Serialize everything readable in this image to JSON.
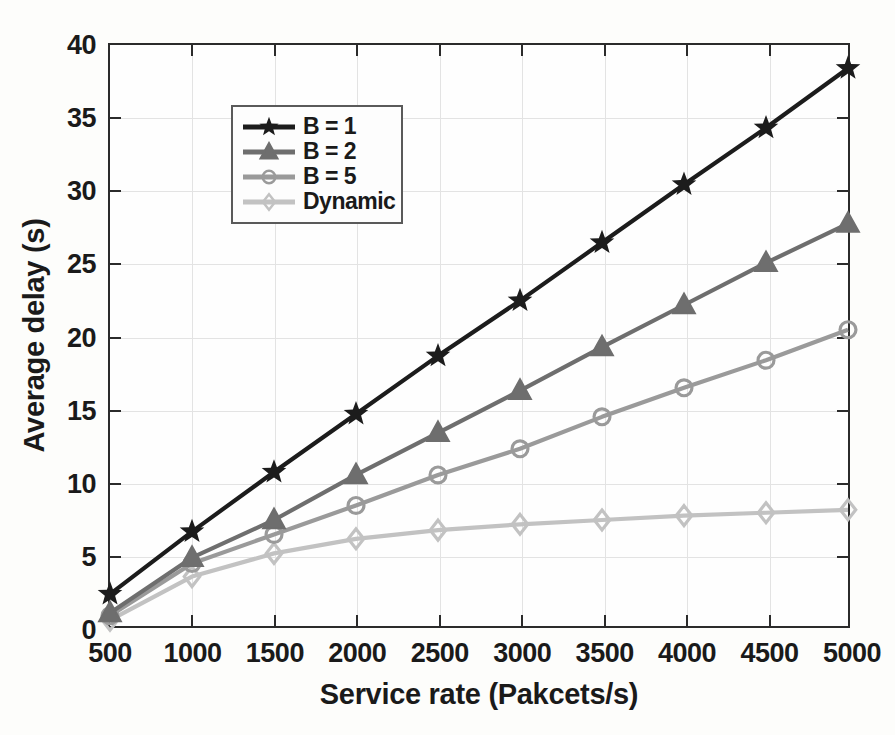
{
  "chart_data": {
    "type": "line",
    "title": "",
    "xlabel": "Service rate (Pakcets/s)",
    "ylabel": "Average delay (s)",
    "x": [
      500,
      1000,
      1500,
      2000,
      2500,
      3000,
      3500,
      4000,
      4500,
      5000
    ],
    "xticklabels": [
      "500",
      "1000",
      "1500",
      "2000",
      "2500",
      "3000",
      "3500",
      "4000",
      "4500",
      "5000"
    ],
    "yticks": [
      0,
      5,
      10,
      15,
      20,
      25,
      30,
      35,
      40
    ],
    "yticklabels": [
      "0",
      "5",
      "10",
      "15",
      "20",
      "25",
      "30",
      "35",
      "40"
    ],
    "xlim": [
      500,
      5000
    ],
    "ylim": [
      0,
      40
    ],
    "grid": true,
    "legend_position": "upper left",
    "series": [
      {
        "name": "B = 1",
        "marker": "star",
        "color": "#1c1c1c",
        "values": [
          2.2,
          6.5,
          10.6,
          14.6,
          18.6,
          22.4,
          26.4,
          30.4,
          34.3,
          38.4
        ]
      },
      {
        "name": "B = 2",
        "marker": "triangle",
        "color": "#6e6e6e",
        "values": [
          0.9,
          4.7,
          7.3,
          10.4,
          13.3,
          16.2,
          19.2,
          22.1,
          25.0,
          27.7
        ]
      },
      {
        "name": "B = 5",
        "marker": "circle",
        "color": "#9a9a9a",
        "values": [
          0.7,
          4.3,
          6.3,
          8.3,
          10.4,
          12.2,
          14.4,
          16.4,
          18.3,
          20.4
        ]
      },
      {
        "name": "Dynamic",
        "marker": "diamond",
        "color": "#c2c2c2",
        "values": [
          0.4,
          3.4,
          5.0,
          6.0,
          6.6,
          7.0,
          7.3,
          7.6,
          7.8,
          8.0
        ]
      }
    ]
  },
  "axes": {
    "y_title": "Average delay (s)",
    "x_title": "Service rate (Pakcets/s)"
  },
  "legend": {
    "entries": [
      {
        "label": "B = 1"
      },
      {
        "label": "B = 2"
      },
      {
        "label": "B = 5"
      },
      {
        "label": "Dynamic"
      }
    ]
  }
}
